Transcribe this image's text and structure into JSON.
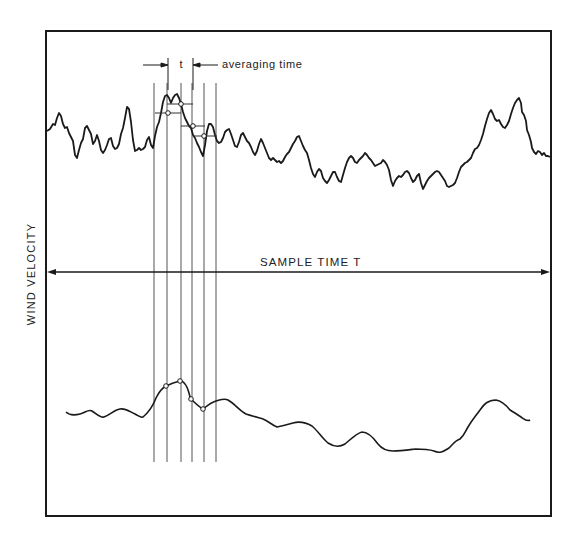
{
  "diagram": {
    "y_axis_label": "WIND VELOCITY",
    "averaging_marker_label": "t",
    "averaging_annotation": "averaging time",
    "sample_span_label": "SAMPLE TIME T",
    "colors": {
      "ink": "#1a1a1a",
      "guide_lines": "#444444",
      "background": "#ffffff"
    },
    "traces": [
      {
        "name": "instantaneous-wind-velocity",
        "description": "Rapidly fluctuating raw signal (upper trace)"
      },
      {
        "name": "averaged-wind-velocity",
        "description": "Smoothed running average of the signal (lower trace)"
      }
    ],
    "averaging_intervals": 5,
    "averaged_sample_points": 4
  }
}
